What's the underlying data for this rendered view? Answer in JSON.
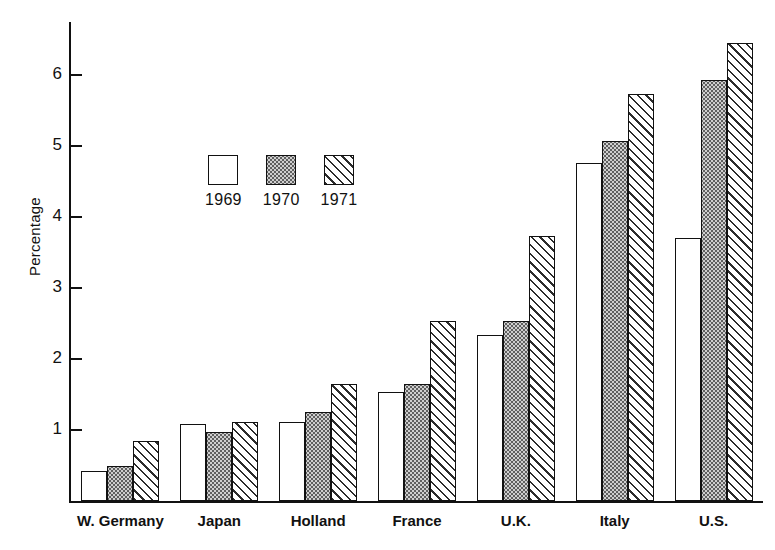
{
  "chart_data": {
    "type": "bar",
    "title": "",
    "xlabel": "",
    "ylabel": "Percentage",
    "ylim": [
      0,
      6.75
    ],
    "yticks": [
      1,
      2,
      3,
      4,
      5,
      6
    ],
    "ytick_labels": [
      "1",
      "2",
      "3",
      "4",
      "5",
      "6"
    ],
    "grid": false,
    "legend_position": "inside-upper-left",
    "categories": [
      "W. Germany",
      "Japan",
      "Holland",
      "France",
      "U.K.",
      "Italy",
      "U.S."
    ],
    "series": [
      {
        "name": "1969",
        "pattern": "open-white",
        "values": [
          0.43,
          1.08,
          1.11,
          1.54,
          2.34,
          4.76,
          3.71
        ]
      },
      {
        "name": "1970",
        "pattern": "stippled-gray",
        "values": [
          0.49,
          0.97,
          1.26,
          1.65,
          2.53,
          5.08,
          5.93
        ]
      },
      {
        "name": "1971",
        "pattern": "diagonal-hatch",
        "values": [
          0.85,
          1.12,
          1.65,
          2.54,
          3.73,
          5.74,
          6.46
        ]
      }
    ]
  },
  "legend": {
    "items": [
      {
        "label": "1969",
        "pattern": "s1969"
      },
      {
        "label": "1970",
        "pattern": "s1970"
      },
      {
        "label": "1971",
        "pattern": "s1971"
      }
    ]
  },
  "colors": {
    "ink": "#111111",
    "background": "#ffffff",
    "stipple_fill": "#cfcfcf",
    "stipple_dot": "#575757",
    "hatch_line": "#2b2b2b"
  }
}
